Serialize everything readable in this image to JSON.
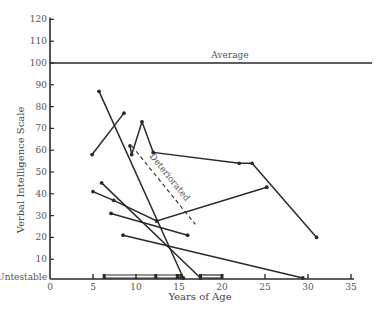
{
  "chart_data": {
    "type": "line",
    "title": "",
    "xlabel": "Years of Age",
    "ylabel": "Verbal Intelligence Scale",
    "xlim": [
      0,
      35
    ],
    "ylim": [
      0,
      120
    ],
    "x_ticks": [
      0,
      5,
      10,
      15,
      20,
      25,
      30,
      35
    ],
    "y_ticks": [
      {
        "value": 0,
        "label": "Untestable"
      },
      {
        "value": 10,
        "label": "10"
      },
      {
        "value": 20,
        "label": "20"
      },
      {
        "value": 30,
        "label": "30"
      },
      {
        "value": 40,
        "label": "40"
      },
      {
        "value": 50,
        "label": "50"
      },
      {
        "value": 60,
        "label": "60"
      },
      {
        "value": 70,
        "label": "70"
      },
      {
        "value": 80,
        "label": "80"
      },
      {
        "value": 90,
        "label": "90"
      },
      {
        "value": 100,
        "label": "100"
      },
      {
        "value": 110,
        "label": "110"
      },
      {
        "value": 120,
        "label": "120"
      }
    ],
    "grid": false,
    "reference_lines": [
      {
        "label": "Average",
        "y": 100,
        "x_range": [
          0,
          37.5
        ]
      }
    ],
    "annotations": [
      {
        "label": "Deteriorated",
        "style": "dashed",
        "points": [
          [
            9.5,
            62
          ],
          [
            16.9,
            26
          ]
        ]
      }
    ],
    "series": [
      {
        "name": "case-1",
        "points": [
          [
            5.7,
            87
          ],
          [
            15.5,
            0
          ]
        ]
      },
      {
        "name": "case-2",
        "points": [
          [
            4.9,
            58
          ],
          [
            8.6,
            77
          ]
        ]
      },
      {
        "name": "case-3",
        "points": [
          [
            9.3,
            62
          ],
          [
            9.5,
            58
          ],
          [
            10.7,
            73
          ],
          [
            12.0,
            59
          ],
          [
            22.0,
            54
          ],
          [
            23.5,
            54
          ],
          [
            31.0,
            20
          ]
        ]
      },
      {
        "name": "case-4",
        "points": [
          [
            6.0,
            45
          ],
          [
            17.5,
            0
          ]
        ]
      },
      {
        "name": "case-5",
        "points": [
          [
            5.0,
            41
          ],
          [
            7.4,
            37
          ],
          [
            12.4,
            27.5
          ],
          [
            25.2,
            43
          ]
        ]
      },
      {
        "name": "case-6",
        "points": [
          [
            7.1,
            31
          ],
          [
            16.0,
            21
          ]
        ]
      },
      {
        "name": "case-7",
        "points": [
          [
            8.5,
            21
          ],
          [
            29.4,
            0
          ]
        ]
      },
      {
        "name": "untestable-a",
        "points": [
          [
            6.3,
            0
          ],
          [
            12.3,
            0
          ],
          [
            14.8,
            0
          ],
          [
            15.3,
            0
          ]
        ]
      },
      {
        "name": "untestable-b",
        "points": [
          [
            17.5,
            0
          ],
          [
            20.0,
            0
          ]
        ]
      }
    ]
  },
  "labels": {
    "average": "Average",
    "deteriorated": "Deteriorated",
    "xlabel": "Years of Age",
    "ylabel": "Verbal Intelligence Scale"
  },
  "colors": {
    "line": "#2a2a2a",
    "text": "#555555"
  }
}
